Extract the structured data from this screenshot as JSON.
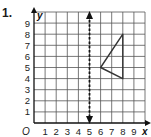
{
  "problem": {
    "number": "1."
  },
  "axes": {
    "x_label": "x",
    "y_label": "y",
    "origin_label": "O",
    "x_ticks": [
      "1",
      "2",
      "3",
      "4",
      "5",
      "6",
      "7",
      "8",
      "9"
    ],
    "y_ticks": [
      "1",
      "2",
      "3",
      "4",
      "5",
      "6",
      "7",
      "8",
      "9"
    ]
  },
  "chart_data": {
    "type": "diagram",
    "title": "",
    "grid": true,
    "xlim": [
      0,
      10
    ],
    "ylim": [
      0,
      10
    ],
    "x_ticks": [
      1,
      2,
      3,
      4,
      5,
      6,
      7,
      8,
      9
    ],
    "y_ticks": [
      1,
      2,
      3,
      4,
      5,
      6,
      7,
      8,
      9
    ],
    "shapes": [
      {
        "type": "triangle",
        "vertices": [
          [
            8,
            8
          ],
          [
            6,
            5
          ],
          [
            8,
            4
          ]
        ]
      }
    ],
    "lines": [
      {
        "type": "line_of_reflection",
        "style": "dashed",
        "equation": "x = 5",
        "arrows": "both"
      }
    ]
  },
  "colors": {
    "grid": "#555555",
    "axis": "#111111",
    "triangle": "#333333",
    "dashed_line": "#111111"
  }
}
